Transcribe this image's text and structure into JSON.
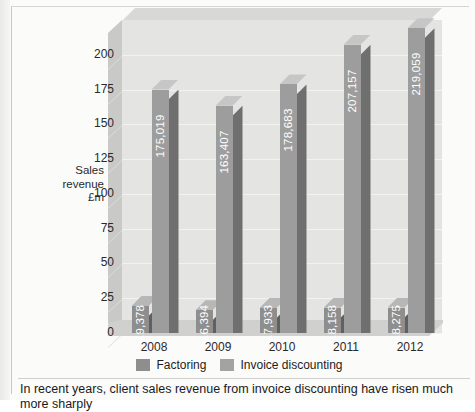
{
  "caption": "In recent years, client sales revenue from invoice discounting have risen much more sharply",
  "legend": {
    "items": [
      {
        "label": "Factoring",
        "color": "#8e8e8e"
      },
      {
        "label": "Invoice discounting",
        "color": "#a3a3a3"
      }
    ]
  },
  "axis": {
    "y_title_line1": "Sales",
    "y_title_line2": "revenue",
    "y_title_line3": "£m"
  },
  "chart_data": {
    "type": "bar",
    "title": "",
    "xlabel": "",
    "ylabel": "Sales revenue £m",
    "categories": [
      "2008",
      "2009",
      "2010",
      "2011",
      "2012"
    ],
    "ylim": [
      0,
      219.059
    ],
    "yticks": [
      200,
      175,
      150,
      125,
      100,
      75,
      50,
      25,
      0
    ],
    "ytick_labels": [
      "200",
      "175",
      "150",
      "125",
      "100",
      "75",
      "50",
      "25",
      "0"
    ],
    "grid": true,
    "legend_position": "bottom",
    "series": [
      {
        "name": "Factoring",
        "color": "#8e8e8e",
        "values": [
          19.378,
          16.394,
          17.933,
          18.158,
          18.275
        ],
        "data_labels": [
          "19,378",
          "16,394",
          "17,933",
          "18,158",
          "18,275"
        ]
      },
      {
        "name": "Invoice discounting",
        "color": "#9d9d9d",
        "values": [
          175.019,
          163.407,
          178.683,
          207.157,
          219.059
        ],
        "data_labels": [
          "175,019",
          "163,407",
          "178,683",
          "207,157",
          "219,059"
        ]
      }
    ]
  }
}
